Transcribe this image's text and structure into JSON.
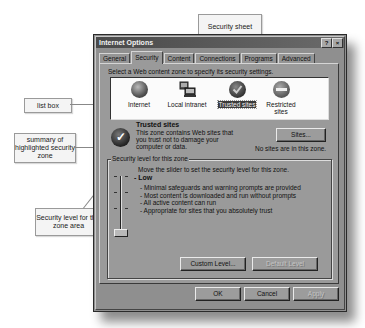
{
  "window": {
    "title": "Internet Options",
    "help_button": "?",
    "close_button": "×"
  },
  "tabs": [
    {
      "label": "General",
      "active": false
    },
    {
      "label": "Security",
      "active": true
    },
    {
      "label": "Content",
      "active": false
    },
    {
      "label": "Connections",
      "active": false
    },
    {
      "label": "Programs",
      "active": false
    },
    {
      "label": "Advanced",
      "active": false
    }
  ],
  "security": {
    "instruction": "Select a Web content zone to specify its security settings.",
    "zones": [
      {
        "label": "Internet",
        "icon": "globe-icon",
        "selected": false
      },
      {
        "label": "Local intranet",
        "icon": "computer-icon",
        "selected": false
      },
      {
        "label": "Trusted sites",
        "icon": "check-circle-icon",
        "selected": true
      },
      {
        "label": "Restricted sites",
        "icon": "no-entry-icon",
        "selected": false
      }
    ],
    "summary": {
      "title": "Trusted sites",
      "description": "This zone contains Web sites that you trust not to damage your computer or data.",
      "sites_button": "Sites...",
      "no_sites_text": "No sites are in this zone."
    },
    "level_group": {
      "legend": "Security level for this zone",
      "instruction": "Move the slider to set the security level for this zone.",
      "level_name": "Low",
      "level_items": [
        "- Minimal safeguards and warning prompts are provided",
        "- Most content is downloaded and run without prompts",
        "- All active content can run",
        "- Appropriate for sites that you absolutely trust"
      ],
      "custom_level_button": "Custom Level...",
      "default_level_button": "Default Level"
    }
  },
  "footer": {
    "ok": "OK",
    "cancel": "Cancel",
    "apply": "Apply"
  },
  "callouts": {
    "security_sheet": "Security sheet",
    "list_box": "list box",
    "summary": "summary of highlighted security zone",
    "security_level": "Security level for this zone area"
  }
}
